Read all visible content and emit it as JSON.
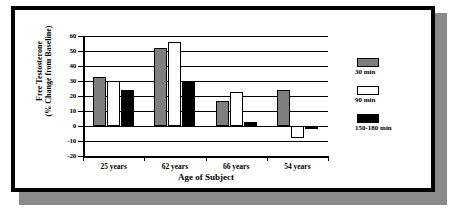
{
  "figure": {
    "frame_color": "#000000",
    "shadow_color": "#8a8a8a",
    "background": "#ffffff"
  },
  "chart_data": {
    "type": "bar",
    "title": "",
    "xlabel": "Age of Subject",
    "ylabel": "Free Testosterone (% Change from Baseline)",
    "ylabel_line1": "Free Testosterone",
    "ylabel_line2": "(% Change from Baseline)",
    "categories": [
      "25 years",
      "62 years",
      "66 years",
      "54 years"
    ],
    "ylim": [
      -20,
      60
    ],
    "yticks": [
      60,
      50,
      40,
      30,
      20,
      10,
      0,
      -10,
      -20
    ],
    "ytick_labels": [
      "60",
      "50",
      "40",
      "30",
      "20",
      "10",
      "0",
      "-10",
      "-20"
    ],
    "grid": true,
    "legend_position": "right",
    "series": [
      {
        "name": "30 min",
        "color": "#7f7f7f",
        "values": [
          33,
          52,
          17,
          24
        ]
      },
      {
        "name": "90 min",
        "color": "#ffffff",
        "values": [
          30,
          56,
          23,
          -8
        ]
      },
      {
        "name": "150-180 min",
        "color": "#000000",
        "values": [
          24,
          30,
          3,
          -2
        ]
      }
    ]
  }
}
